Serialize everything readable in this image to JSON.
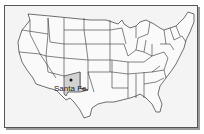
{
  "map": {
    "region": "Contiguous United States",
    "highlighted_state": "New Mexico",
    "colors": {
      "background": "#f4f4f4",
      "land": "#fafafa",
      "border": "#333333",
      "highlight": "#d2d2d2",
      "marker": "#111111"
    },
    "marker": {
      "label": "Santa Fe",
      "type": "city-dot"
    }
  }
}
